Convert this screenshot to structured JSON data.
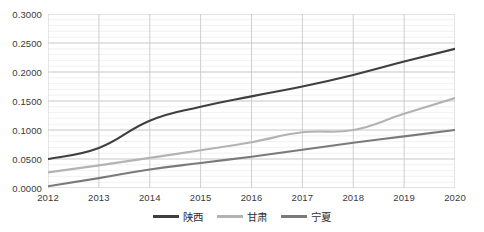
{
  "chart_data": {
    "type": "line",
    "title": "",
    "subtitle": "",
    "xlabel": "",
    "ylabel": "",
    "categories": [
      "2012",
      "2013",
      "2014",
      "2015",
      "2016",
      "2017",
      "2018",
      "2019",
      "2020"
    ],
    "x": [
      2012,
      2013,
      2014,
      2015,
      2016,
      2017,
      2018,
      2019,
      2020
    ],
    "xlim": [
      2012,
      2020
    ],
    "ylim": [
      0.0,
      0.3
    ],
    "y_ticks": [
      0.0,
      0.05,
      0.1,
      0.15,
      0.2,
      0.25,
      0.3
    ],
    "y_tick_labels": [
      "0.0000",
      "0.0500",
      "0.1000",
      "0.1500",
      "0.2000",
      "0.2500",
      "0.3000"
    ],
    "grid": true,
    "grid_minor": true,
    "legend_position": "bottom",
    "series": [
      {
        "name": "陕西",
        "color": "#3f3f3f",
        "values": [
          0.05,
          0.069,
          0.116,
          0.14,
          0.158,
          0.175,
          0.195,
          0.218,
          0.24
        ]
      },
      {
        "name": "甘肃",
        "color": "#b3b3b3",
        "values": [
          0.027,
          0.039,
          0.052,
          0.065,
          0.079,
          0.096,
          0.1,
          0.128,
          0.155
        ]
      },
      {
        "name": "宁夏",
        "color": "#7a7a7a",
        "values": [
          0.003,
          0.017,
          0.032,
          0.043,
          0.054,
          0.066,
          0.078,
          0.089,
          0.1
        ]
      }
    ]
  },
  "colors": {
    "background": "#ffffff",
    "grid_major": "#c9c9c9",
    "grid_minor": "#ededed",
    "axis_text": "#3a3a3a",
    "series_1": "#3f3f3f",
    "series_2": "#b3b3b3",
    "series_3": "#7a7a7a"
  },
  "legend": {
    "items": [
      {
        "label": "陕西",
        "color": "#3f3f3f"
      },
      {
        "label": "甘肃",
        "color": "#b3b3b3"
      },
      {
        "label": "宁夏",
        "color": "#7a7a7a"
      }
    ]
  }
}
